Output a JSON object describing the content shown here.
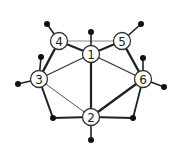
{
  "diagram": {
    "type": "graph",
    "nodes": [
      {
        "id": "1",
        "label": "1",
        "x": 91,
        "y": 54
      },
      {
        "id": "2",
        "label": "2",
        "x": 91,
        "y": 117
      },
      {
        "id": "3",
        "label": "3",
        "x": 39,
        "y": 79
      },
      {
        "id": "4",
        "label": "4",
        "x": 59,
        "y": 41
      },
      {
        "id": "5",
        "label": "5",
        "x": 122,
        "y": 41
      },
      {
        "id": "6",
        "label": "6",
        "x": 143,
        "y": 79
      }
    ],
    "dots": [
      {
        "id": "d-top",
        "x": 91,
        "y": 32
      },
      {
        "id": "d-4",
        "x": 47,
        "y": 24
      },
      {
        "id": "d-5",
        "x": 141,
        "y": 24
      },
      {
        "id": "d-left-upper",
        "x": 41,
        "y": 57
      },
      {
        "id": "d-right-upper",
        "x": 143,
        "y": 58
      },
      {
        "id": "d-left",
        "x": 18,
        "y": 84
      },
      {
        "id": "d-right",
        "x": 164,
        "y": 87
      },
      {
        "id": "d-bottom-left",
        "x": 53,
        "y": 118
      },
      {
        "id": "d-bottom-right",
        "x": 133,
        "y": 118
      },
      {
        "id": "d-bottom",
        "x": 91,
        "y": 140
      }
    ]
  }
}
